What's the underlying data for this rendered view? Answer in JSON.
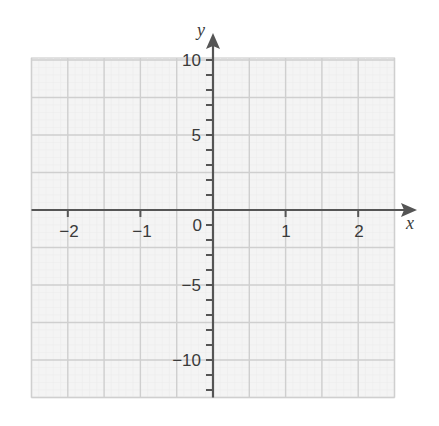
{
  "chart_data": {
    "type": "line",
    "title": "",
    "xlabel": "x",
    "ylabel": "y",
    "xlim": [
      -2.5,
      2.5
    ],
    "ylim": [
      -12.5,
      10
    ],
    "grid": true,
    "grid_major_x_step": 0.5,
    "grid_major_y_step": 2.5,
    "x_ticks": [
      -2,
      -1,
      1,
      2
    ],
    "x_tick_labels": [
      "−2",
      "−1",
      "1",
      "2"
    ],
    "y_ticks": [
      10,
      5,
      -5,
      -10
    ],
    "y_tick_labels": [
      "10",
      "5",
      "−5",
      "−10"
    ],
    "y_minor_tick_step": 1,
    "origin_label": "0",
    "series": []
  },
  "colors": {
    "axis": "#555555",
    "grid_major": "#cfcfcf",
    "grid_minor": "#ececec",
    "grid_background": "#f4f4f4",
    "text": "#3a3a3a"
  }
}
